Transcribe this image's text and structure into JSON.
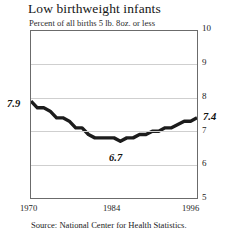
{
  "header": {
    "title": "Low birthweight infants",
    "subtitle": "Percent of all births 5 lb. 8oz. or less"
  },
  "footer": {
    "source": "Source: National Center for Health Statistics."
  },
  "callouts": {
    "start": "7.9",
    "minimum": "6.7",
    "end": "7.4"
  },
  "axes": {
    "y_ticks": [
      "10",
      "9",
      "8",
      "7",
      "6",
      "5"
    ],
    "x_ticks": [
      "1970",
      "1984",
      "1996"
    ]
  },
  "chart_data": {
    "type": "line",
    "title": "Low birthweight infants",
    "subtitle": "Percent of all births 5 lb. 8oz. or less",
    "xlabel": "",
    "ylabel": "",
    "xlim": [
      1970,
      1996
    ],
    "ylim": [
      5,
      10
    ],
    "y_ticks": [
      5,
      6,
      7,
      8,
      9,
      10
    ],
    "x_ticks": [
      1970,
      1984,
      1996
    ],
    "grid": true,
    "legend": false,
    "line_color": "#1c1c1c",
    "series": [
      {
        "name": "Percent of all births 5 lb. 8oz. or less",
        "x": [
          1970,
          1971,
          1972,
          1973,
          1974,
          1975,
          1976,
          1977,
          1978,
          1979,
          1980,
          1981,
          1982,
          1983,
          1984,
          1985,
          1986,
          1987,
          1988,
          1989,
          1990,
          1991,
          1992,
          1993,
          1994,
          1995,
          1996
        ],
        "values": [
          7.9,
          7.7,
          7.7,
          7.6,
          7.4,
          7.4,
          7.3,
          7.1,
          7.1,
          6.9,
          6.8,
          6.8,
          6.8,
          6.8,
          6.7,
          6.8,
          6.8,
          6.9,
          6.9,
          7.0,
          7.0,
          7.1,
          7.1,
          7.2,
          7.3,
          7.3,
          7.4
        ]
      }
    ],
    "annotations": [
      {
        "label": "7.9",
        "x": 1970,
        "y": 7.9,
        "position": "left"
      },
      {
        "label": "6.7",
        "x": 1984,
        "y": 6.7,
        "position": "below"
      },
      {
        "label": "7.4",
        "x": 1996,
        "y": 7.4,
        "position": "right"
      }
    ],
    "source": "Source: National Center for Health Statistics."
  }
}
